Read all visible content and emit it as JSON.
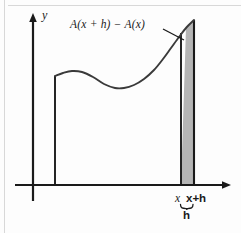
{
  "figure": {
    "kind": "calculus-area-accumulation-diagram",
    "background_color": "#fdfdfd",
    "ink_color": "#1a1a1a",
    "shade_color": "#b5b5b5",
    "scan_rule_color": "#d8d8d8"
  },
  "labels": {
    "expression": "A(x + h) − A(x)",
    "y_axis": "y",
    "x_tick": "x",
    "x_plus_h_tick": "x+h",
    "brace_width": "h"
  },
  "chart_data": {
    "type": "line",
    "title": "",
    "subtitle": "",
    "xlabel": "",
    "ylabel": "y",
    "grid": false,
    "legend": null,
    "axes": {
      "x_axis": {
        "y_pixel": 185,
        "x_start": 15,
        "x_end": 231,
        "arrow": "right"
      },
      "y_axis": {
        "x_pixel": 33,
        "y_top": 16,
        "y_bottom": 201,
        "arrow": "up"
      }
    },
    "annotations": [
      {
        "text": "A(x + h) − A(x)",
        "role": "shaded-strip-callout",
        "leader_from": [
          163,
          29
        ],
        "leader_to": [
          184,
          40
        ]
      },
      {
        "text": "x",
        "role": "x-tick-label",
        "at_x": 181
      },
      {
        "text": "x+h",
        "role": "x-tick-label",
        "at_x": 194
      },
      {
        "text": "h",
        "role": "brace-label",
        "spans_x": [
          181,
          194
        ]
      }
    ],
    "curve": {
      "name": "f(x)",
      "x_start": 55,
      "x_end": 194,
      "points": [
        [
          55,
          76
        ],
        [
          63,
          73
        ],
        [
          72,
          71
        ],
        [
          82,
          72
        ],
        [
          93,
          77
        ],
        [
          104,
          84
        ],
        [
          115,
          88
        ],
        [
          124,
          88
        ],
        [
          134,
          85
        ],
        [
          144,
          79
        ],
        [
          154,
          70
        ],
        [
          163,
          59
        ],
        [
          171,
          48
        ],
        [
          179,
          37
        ],
        [
          186,
          28
        ],
        [
          194,
          20
        ]
      ]
    },
    "vertical_ordinates": [
      {
        "name": "left-ordinate",
        "x": 55,
        "y_top": 76,
        "y_bottom": 185
      },
      {
        "name": "ordinate-at-x",
        "x": 181,
        "y_top": 33,
        "y_bottom": 185
      },
      {
        "name": "ordinate-at-x-plus-h",
        "x": 194,
        "y_top": 20,
        "y_bottom": 185
      }
    ],
    "shaded_region": {
      "name": "area-increment-strip",
      "x_left": 181,
      "x_right": 194,
      "y_bottom": 185,
      "fill": "#b5b5b5",
      "meaning": "A(x + h) − A(x)"
    }
  }
}
